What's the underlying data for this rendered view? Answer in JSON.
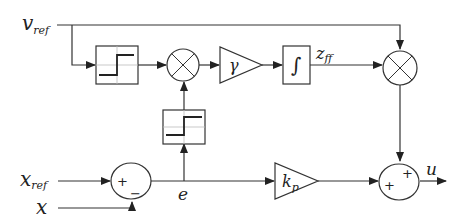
{
  "diagram": {
    "type": "control block diagram",
    "signals": {
      "v_ref": {
        "main": "v",
        "sub": "ref"
      },
      "x_ref": {
        "main": "x",
        "sub": "ref"
      },
      "x": {
        "main": "x"
      },
      "e": {
        "main": "e"
      },
      "z_ff": {
        "main": "z",
        "sub": "ff"
      },
      "u": {
        "main": "u"
      }
    },
    "blocks": {
      "relay_1": {
        "kind": "relay / sign function"
      },
      "multiplier_1": {
        "kind": "product"
      },
      "gain_gamma": {
        "symbol": "γ"
      },
      "integrator": {
        "symbol": "∫"
      },
      "multiplier_2": {
        "kind": "product"
      },
      "relay_2": {
        "kind": "relay / sign function"
      },
      "sum_1": {
        "sign_top": "+",
        "sign_bottom": "−"
      },
      "gain_kp": {
        "main": "k",
        "sub": "p"
      },
      "sum_2": {
        "sign_top": "+",
        "sign_left": "+"
      }
    },
    "colors": {
      "stroke": "#333333",
      "grid": "#bbbbbb",
      "text": "#222222"
    }
  }
}
